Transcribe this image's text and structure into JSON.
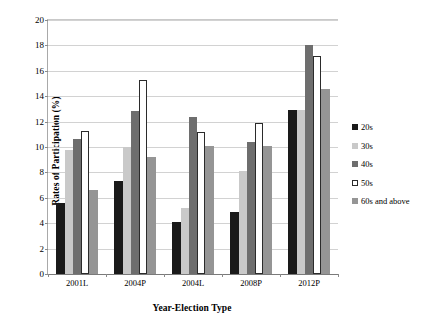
{
  "chart_data": {
    "type": "bar",
    "title": "",
    "xlabel": "Year-Election Type",
    "ylabel": "Rates of Participation (%)",
    "categories": [
      "2001L",
      "2004P",
      "2004L",
      "2008P",
      "2012P"
    ],
    "series": [
      {
        "name": "20s",
        "color": "#1a1a1a",
        "border": "#1a1a1a",
        "values": [
          5.6,
          7.3,
          4.1,
          4.9,
          12.9
        ]
      },
      {
        "name": "30s",
        "color": "#c9c9c9",
        "border": "#c9c9c9",
        "values": [
          9.8,
          10.0,
          5.2,
          8.1,
          12.9
        ]
      },
      {
        "name": "40s",
        "color": "#6e6e6e",
        "border": "#6e6e6e",
        "values": [
          10.6,
          12.8,
          12.4,
          10.4,
          18.0
        ]
      },
      {
        "name": "50s",
        "color": "#ffffff",
        "border": "#2b2b2b",
        "values": [
          11.3,
          15.3,
          11.2,
          11.9,
          17.2
        ]
      },
      {
        "name": "60s and above",
        "color": "#959595",
        "border": "#959595",
        "values": [
          6.6,
          9.2,
          10.1,
          10.1,
          14.6
        ]
      }
    ],
    "ylim": [
      0,
      20
    ],
    "ytick_step": 2,
    "yticks": [
      "0",
      "2",
      "4",
      "6",
      "8",
      "10",
      "12",
      "14",
      "16",
      "18",
      "20"
    ],
    "grid": true,
    "legend_position": "right"
  },
  "legend": {
    "items": [
      {
        "label": "20s"
      },
      {
        "label": "30s"
      },
      {
        "label": "40s"
      },
      {
        "label": "50s"
      },
      {
        "label": "60s and above"
      }
    ]
  }
}
